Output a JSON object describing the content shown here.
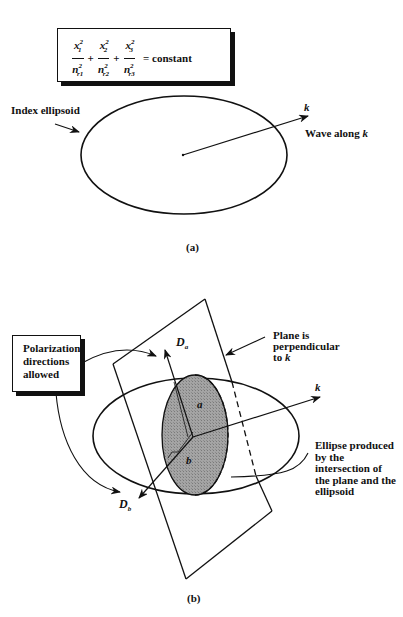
{
  "figure_a": {
    "equation": {
      "terms": [
        {
          "numerator_var": "x",
          "numerator_sub": "1",
          "numerator_sup": "2",
          "denominator_var": "n",
          "denominator_sub": "r1",
          "denominator_sup": "2"
        },
        {
          "numerator_var": "x",
          "numerator_sub": "2",
          "numerator_sup": "2",
          "denominator_var": "n",
          "denominator_sub": "r2",
          "denominator_sup": "2"
        },
        {
          "numerator_var": "x",
          "numerator_sub": "3",
          "numerator_sup": "2",
          "denominator_var": "n",
          "denominator_sub": "r3",
          "denominator_sup": "2"
        }
      ],
      "plus": "+",
      "rhs": "= constant"
    },
    "index_ellipsoid_label": "Index ellipsoid",
    "k_label": "k",
    "wave_label_prefix": "Wave along ",
    "wave_label_var": "k",
    "caption": "(a)"
  },
  "figure_b": {
    "polarization_box": [
      "Polarization",
      "directions",
      "allowed"
    ],
    "da_label_main": "D",
    "da_label_sub": "a",
    "db_label_main": "D",
    "db_label_sub": "b",
    "a_label": "a",
    "b_label": "b",
    "k_label": "k",
    "plane_label": [
      "Plane is",
      "perpendicular",
      "to "
    ],
    "plane_label_var": "k",
    "ellipse_label": [
      "Ellipse produced",
      "by the",
      "intersection of",
      "the plane and the",
      "ellipsoid"
    ],
    "caption": "(b)"
  },
  "colors": {
    "line": "#111111",
    "shaded_ellipse": "#9a9a9a",
    "background": "#ffffff"
  }
}
